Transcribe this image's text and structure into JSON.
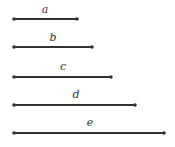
{
  "segments": [
    {
      "label": "a",
      "x1": 14,
      "x2": 77,
      "y": 19
    },
    {
      "label": "b",
      "x1": 14,
      "x2": 92,
      "y": 47
    },
    {
      "label": "c",
      "x1": 14,
      "x2": 111,
      "y": 77
    },
    {
      "label": "d",
      "x1": 14,
      "x2": 135,
      "y": 105
    },
    {
      "label": "e",
      "x1": 14,
      "x2": 164,
      "y": 133
    }
  ],
  "colors": {
    "line": "#333333"
  }
}
